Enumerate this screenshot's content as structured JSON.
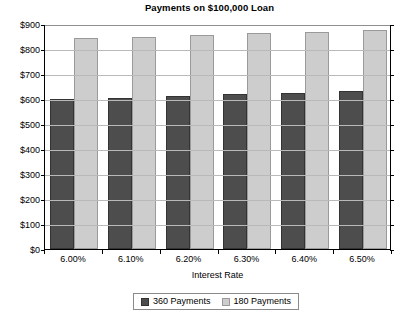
{
  "chart_data": {
    "type": "bar",
    "title": "Payments on $100,000 Loan",
    "xlabel": "Interest Rate",
    "ylabel": "",
    "categories": [
      "6.00%",
      "6.10%",
      "6.20%",
      "6.30%",
      "6.40%",
      "6.50%"
    ],
    "series": [
      {
        "name": "360 Payments",
        "color": "#4d4d4d",
        "values": [
          600,
          606,
          613,
          620,
          626,
          633
        ]
      },
      {
        "name": "180 Payments",
        "color": "#cdcdcd",
        "values": [
          844,
          850,
          857,
          863,
          870,
          877
        ]
      }
    ],
    "ylim": [
      0,
      900
    ],
    "ytick_step": 100,
    "ytick_labels": [
      "$0",
      "$100",
      "$200",
      "$300",
      "$400",
      "$500",
      "$600",
      "$700",
      "$800",
      "$900"
    ],
    "grid": true,
    "legend_position": "bottom-center"
  }
}
